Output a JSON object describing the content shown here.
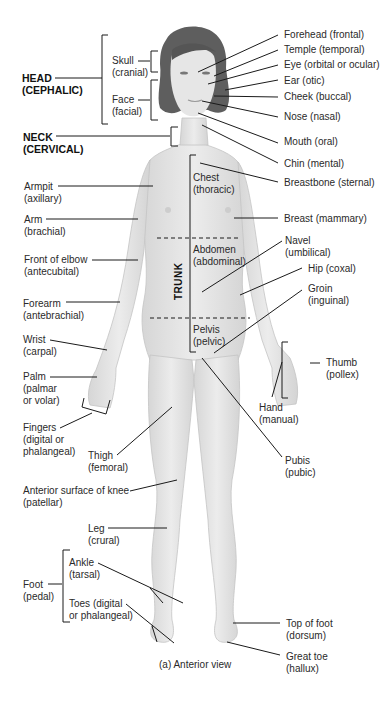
{
  "figure": {
    "caption": "(a) Anterior view",
    "colors": {
      "skin": "#e3e3e3",
      "skin_shade": "#cfcfcf",
      "hair": "#5a5a5a",
      "line": "#1a1a1a",
      "text": "#2a2a2a"
    }
  },
  "regions": {
    "head": {
      "name": "HEAD",
      "term": "(CEPHALIC)"
    },
    "neck": {
      "name": "NECK",
      "term": "(CERVICAL)"
    },
    "trunk": {
      "name": "TRUNK"
    }
  },
  "left_labels": {
    "skull": {
      "name": "Skull",
      "term": "(cranial)"
    },
    "face": {
      "name": "Face",
      "term": "(facial)"
    },
    "armpit": {
      "name": "Armpit",
      "term": "(axillary)"
    },
    "arm": {
      "name": "Arm",
      "term": "(brachial)"
    },
    "elbow": {
      "name": "Front of elbow",
      "term": "(antecubital)"
    },
    "forearm": {
      "name": "Forearm",
      "term": "(antebrachial)"
    },
    "wrist": {
      "name": "Wrist",
      "term": "(carpal)"
    },
    "palm": {
      "name": "Palm",
      "term": "(palmar",
      "term2": "or volar)"
    },
    "fingers": {
      "name": "Fingers",
      "term": "(digital or",
      "term2": "phalangeal)"
    },
    "thigh": {
      "name": "Thigh",
      "term": "(femoral)"
    },
    "knee": {
      "name": "Anterior surface of knee",
      "term": "(patellar)"
    },
    "leg": {
      "name": "Leg",
      "term": "(crural)"
    },
    "foot": {
      "name": "Foot",
      "term": "(pedal)"
    },
    "ankle": {
      "name": "Ankle",
      "term": "(tarsal)"
    },
    "toes": {
      "name": "Toes (digital",
      "term": "or phalangeal)"
    }
  },
  "trunk_labels": {
    "chest": {
      "name": "Chest",
      "term": "(thoracic)"
    },
    "abdomen": {
      "name": "Abdomen",
      "term": "(abdominal)"
    },
    "pelvis": {
      "name": "Pelvis",
      "term": "(pelvic)"
    }
  },
  "right_labels": {
    "forehead": "Forehead (frontal)",
    "temple": "Temple (temporal)",
    "eye": "Eye (orbital or ocular)",
    "ear": "Ear (otic)",
    "cheek": "Cheek (buccal)",
    "nose": "Nose (nasal)",
    "mouth": "Mouth (oral)",
    "chin": "Chin (mental)",
    "breastbone": "Breastbone (sternal)",
    "breast": "Breast (mammary)",
    "navel": {
      "name": "Navel",
      "term": "(umbilical)"
    },
    "hip": "Hip (coxal)",
    "groin": {
      "name": "Groin",
      "term": "(inguinal)"
    },
    "thumb": {
      "name": "Thumb",
      "term": "(pollex)"
    },
    "hand": {
      "name": "Hand",
      "term": "(manual)"
    },
    "pubis": {
      "name": "Pubis",
      "term": "(pubic)"
    },
    "top_of_foot": {
      "name": "Top of foot",
      "term": "(dorsum)"
    },
    "great_toe": {
      "name": "Great toe",
      "term": "(hallux)"
    }
  }
}
